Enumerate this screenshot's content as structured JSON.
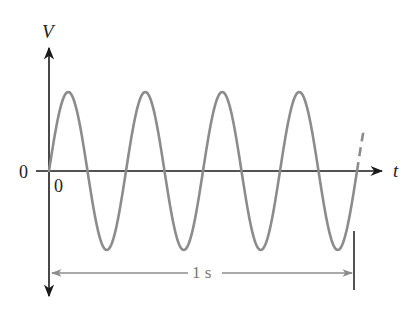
{
  "diagram": {
    "v_axis_label": "V",
    "t_axis_label": "t",
    "origin_v_label": "0",
    "origin_t_label": "0",
    "interval_label": "1 s",
    "cycles_shown": 4,
    "colors": {
      "axis": "#1a1a1a",
      "wave": "#8c8c8c",
      "dimension_arrow": "#8c8c8c",
      "marker": "#1a1a1a"
    }
  },
  "chart_data": {
    "type": "line",
    "title": "",
    "xlabel": "t",
    "ylabel": "V",
    "function": "V = sin(2*pi*4*t)",
    "frequency_hz": 4,
    "period_s": 0.25,
    "x_range": [
      0,
      1.0
    ],
    "x": [
      0,
      0.0625,
      0.125,
      0.1875,
      0.25,
      0.3125,
      0.375,
      0.4375,
      0.5,
      0.5625,
      0.625,
      0.6875,
      0.75,
      0.8125,
      0.875,
      0.9375,
      1.0
    ],
    "values": [
      0,
      1,
      0,
      -1,
      0,
      1,
      0,
      -1,
      0,
      1,
      0,
      -1,
      0,
      1,
      0,
      -1,
      0
    ],
    "annotations": [
      "1 s interval spans 4 complete cycles",
      "dashed continuation after t = 1 s"
    ],
    "grid": false
  }
}
